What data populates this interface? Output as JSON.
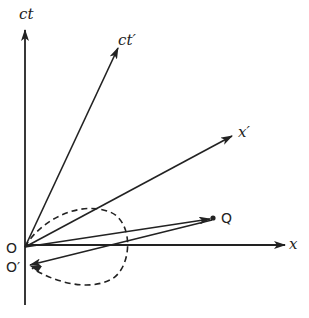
{
  "diagram": {
    "labels": {
      "ct": "ct",
      "ct_prime": "ct′",
      "x": "x",
      "x_prime": "x′",
      "origin": "O",
      "origin_prime": "O′",
      "event": "Q"
    },
    "colors": {
      "ink": "#222222",
      "background": "#ffffff"
    }
  }
}
